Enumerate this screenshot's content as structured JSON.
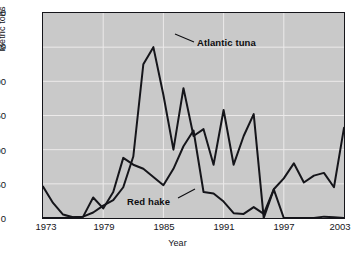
{
  "chart_data": {
    "type": "line",
    "title": "",
    "xlabel": "Year",
    "ylabel": "Metric tons",
    "xlim": [
      1973,
      2003
    ],
    "ylim": [
      0,
      300
    ],
    "xticks": [
      1973,
      1979,
      1985,
      1991,
      1997,
      2003
    ],
    "yticks": [
      0,
      50,
      100,
      150,
      200,
      250,
      300
    ],
    "grid": true,
    "legend_position": "inline-annotation",
    "background_color": "#c9c9c9",
    "line_color": "#15151a",
    "x": [
      1973,
      1974,
      1975,
      1976,
      1977,
      1978,
      1979,
      1980,
      1981,
      1982,
      1983,
      1984,
      1985,
      1986,
      1987,
      1988,
      1989,
      1990,
      1991,
      1992,
      1993,
      1994,
      1995,
      1996,
      1997,
      1998,
      1999,
      2000,
      2001,
      2002,
      2003
    ],
    "series": [
      {
        "name": "Atlantic tuna",
        "annotation": "Atlantic tuna",
        "values": [
          0,
          0,
          0,
          1,
          2,
          8,
          18,
          26,
          45,
          90,
          225,
          250,
          180,
          100,
          190,
          120,
          130,
          78,
          158,
          78,
          120,
          152,
          0,
          42,
          0,
          0,
          0,
          0,
          2,
          1,
          0
        ]
      },
      {
        "name": "Red hake",
        "annotation": "Red hake",
        "values": [
          46,
          22,
          5,
          1,
          2,
          30,
          14,
          38,
          88,
          78,
          72,
          60,
          48,
          72,
          105,
          128,
          38,
          36,
          24,
          7,
          6,
          16,
          6,
          42,
          58,
          80,
          52,
          62,
          66,
          45,
          132
        ]
      }
    ]
  },
  "axes": {
    "y_title": "Metric tons",
    "x_title": "Year",
    "y_tick_labels": [
      "300",
      "250",
      "200",
      "150",
      "100",
      "50",
      "0"
    ],
    "x_tick_labels": [
      "1973",
      "1979",
      "1985",
      "1991",
      "1997",
      "2003"
    ]
  }
}
